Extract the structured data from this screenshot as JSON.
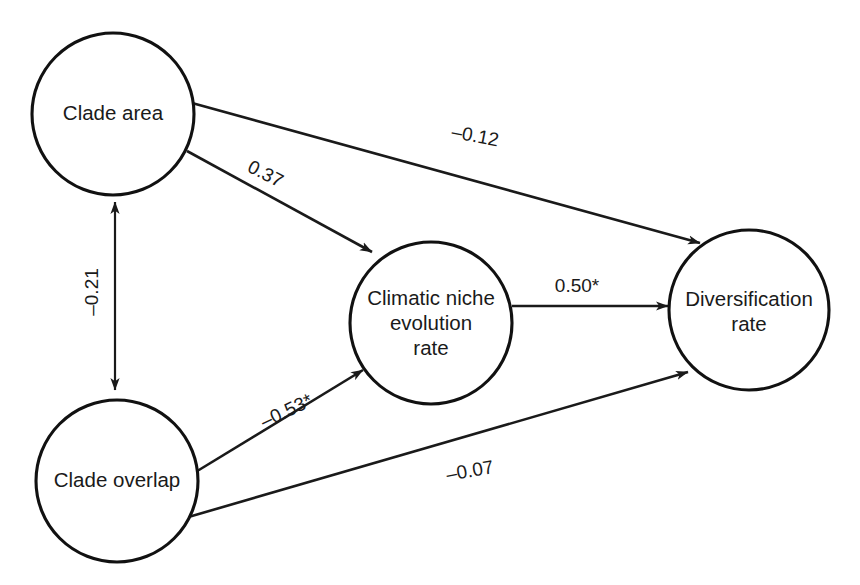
{
  "figure": {
    "type": "path-diagram",
    "background_color": "#ffffff",
    "stroke_color": "#1a1a1a",
    "text_color": "#1a1a1a"
  },
  "nodes": [
    {
      "id": "clade_area",
      "label": "Clade area",
      "lines": [
        "Clade area"
      ],
      "cx": 113,
      "cy": 114,
      "r": 81
    },
    {
      "id": "clade_overlap",
      "label": "Clade overlap",
      "lines": [
        "Clade overlap"
      ],
      "cx": 117,
      "cy": 481,
      "r": 81
    },
    {
      "id": "climatic_niche",
      "label": "Climatic niche evolution rate",
      "lines": [
        "Climatic niche",
        "evolution",
        "rate"
      ],
      "cx": 431,
      "cy": 323,
      "r": 81
    },
    {
      "id": "diversification",
      "label": "Diversification rate",
      "lines": [
        "Diversification",
        "rate"
      ],
      "cx": 749,
      "cy": 310,
      "r": 80
    }
  ],
  "edges": [
    {
      "id": "clade_area_to_diversification",
      "from": "clade_area",
      "to": "diversification",
      "coefficient": "–0.12",
      "arrow": "single",
      "label_x": 475,
      "label_y": 137,
      "label_rotation": 11
    },
    {
      "id": "clade_area_to_climatic_niche",
      "from": "clade_area",
      "to": "climatic_niche",
      "coefficient": "0.37",
      "arrow": "single",
      "label_x": 265,
      "label_y": 175,
      "label_rotation": 27
    },
    {
      "id": "clade_area_clade_overlap_correlation",
      "from": "clade_area",
      "to": "clade_overlap",
      "coefficient": "–0.21",
      "arrow": "double",
      "label_x": 93,
      "label_y": 292,
      "label_rotation": -90
    },
    {
      "id": "clade_overlap_to_climatic_niche",
      "from": "clade_overlap",
      "to": "climatic_niche",
      "coefficient": "–0.53*",
      "arrow": "single",
      "label_x": 287,
      "label_y": 412,
      "label_rotation": -25
    },
    {
      "id": "clade_overlap_to_diversification",
      "from": "clade_overlap",
      "to": "diversification",
      "coefficient": "–0.07",
      "arrow": "single",
      "label_x": 470,
      "label_y": 472,
      "label_rotation": -10
    },
    {
      "id": "climatic_niche_to_diversification",
      "from": "climatic_niche",
      "to": "diversification",
      "coefficient": "0.50*",
      "arrow": "single",
      "label_x": 577,
      "label_y": 287,
      "label_rotation": 0
    }
  ],
  "geometry": {
    "edge_paths": {
      "clade_area_to_diversification": "M192,103 L700,243",
      "clade_area_to_climatic_niche": "M187,151 L372,252",
      "correlation_line": "M115,202 L115,390",
      "clade_overlap_to_climatic_niche": "M194,473 L363,370",
      "clade_overlap_to_diversification": "M185,518 L688,372",
      "climatic_niche_to_diversification": "M512,306 L668,306"
    }
  }
}
